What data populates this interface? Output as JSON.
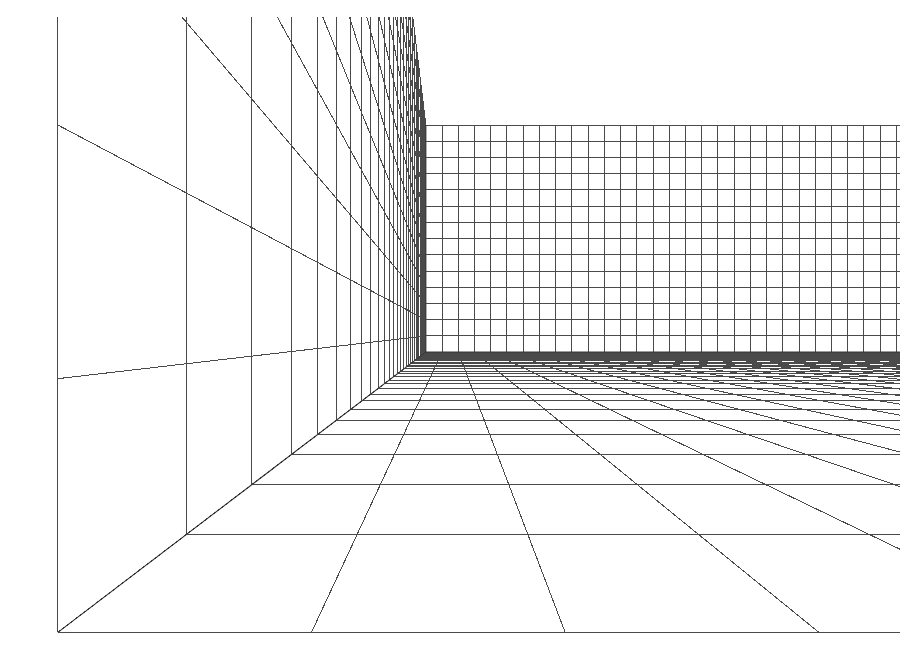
{
  "canvas": {
    "width": 902,
    "height": 667,
    "background_color": "#ffffff",
    "title": "Perspective Wireframe Room"
  },
  "style": {
    "line_color": "#4a4a4a",
    "minor_line_color": "#5c5c5c",
    "edge_color": "#3a3a3a",
    "line_width": 1,
    "edge_width": 1.1
  },
  "margins": {
    "left": 18,
    "top": 17,
    "right": 2,
    "bottom": 12
  },
  "camera": {
    "focal_length": 520,
    "eye_x": 1.55,
    "eye_y": 1.18,
    "eye_z": -2.05,
    "screen_center_x": 451,
    "screen_center_y": 333,
    "description": "single-point-ish perspective, camera inside a rectangular room looking at the back-left corner"
  },
  "room": {
    "width_units": 30,
    "height_units": 14,
    "depth_units": 30,
    "cell_size": 1,
    "surfaces": [
      {
        "id": "left-wall",
        "name": "left wall",
        "visible": true,
        "grid_rows": 14,
        "grid_cols": 30
      },
      {
        "id": "back-wall",
        "name": "back wall",
        "visible": true,
        "grid_rows": 14,
        "grid_cols": 30
      },
      {
        "id": "right-wall",
        "name": "right wall",
        "visible": true,
        "grid_rows": 14,
        "grid_cols": 30
      },
      {
        "id": "floor",
        "name": "floor",
        "visible": true,
        "grid_rows": 30,
        "grid_cols": 30
      }
    ]
  },
  "corners": {
    "back_left_vertical_top": {
      "x": 313,
      "y": 17
    },
    "back_left_vertical_bottom": {
      "x": 313,
      "y": 118
    },
    "left_wall_front_bottom": {
      "x": 22,
      "y": 312
    },
    "back_right_vertical_top": {
      "x": 875,
      "y": 17
    },
    "back_right_vertical_bottom": {
      "x": 875,
      "y": 271
    }
  },
  "chart_data": {
    "type": "line",
    "xlabel": "",
    "ylabel": "",
    "series": [
      {
        "name": "left-wall-verticals",
        "count": 30
      },
      {
        "name": "left-wall-horizontals",
        "count": 15
      },
      {
        "name": "back-wall-verticals",
        "count": 31
      },
      {
        "name": "back-wall-horizontals",
        "count": 15
      },
      {
        "name": "right-wall-verticals",
        "count": 30
      },
      {
        "name": "right-wall-horizontals",
        "count": 15
      },
      {
        "name": "floor-depth-lines",
        "count": 31
      },
      {
        "name": "floor-width-lines",
        "count": 31
      }
    ],
    "grid": true,
    "legend": "none"
  }
}
